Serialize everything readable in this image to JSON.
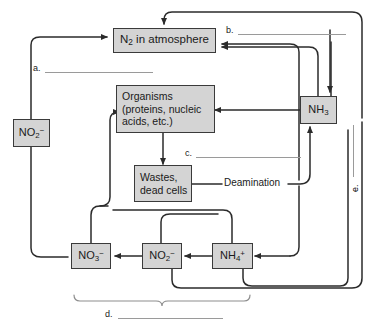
{
  "diagram": {
    "box_fill": "#d4d4d4",
    "box_stroke": "#3a3a3a",
    "arrow_color": "#2b2b2b",
    "blank_color": "#9a9a9a"
  },
  "nodes": {
    "n2_atmosphere": {
      "label": "N2 in atmosphere",
      "text_main": "N",
      "sub": "2",
      "text_rest": " in atmosphere"
    },
    "organisms": {
      "line1": "Organisms",
      "line2": "(proteins, nucleic",
      "line3": "acids, etc.)"
    },
    "wastes": {
      "line1": "Wastes,",
      "line2": "dead cells"
    },
    "nh3": {
      "text_main": "NH",
      "sub": "3"
    },
    "nitrite_left": {
      "text_main": "NO",
      "sub": "2",
      "sup": "−"
    },
    "nitrate_bottom": {
      "text_main": "NO",
      "sub": "3",
      "sup": "−"
    },
    "nitrite_bottom": {
      "text_main": "NO",
      "sub": "2",
      "sup": "−"
    },
    "ammonium_bottom": {
      "text_main": "NH",
      "sub": "4",
      "sup": "+"
    }
  },
  "labels": {
    "a": "a.",
    "b": "b.",
    "c": "c.",
    "d": "d.",
    "e": "e.",
    "deamination": "Deamination"
  }
}
